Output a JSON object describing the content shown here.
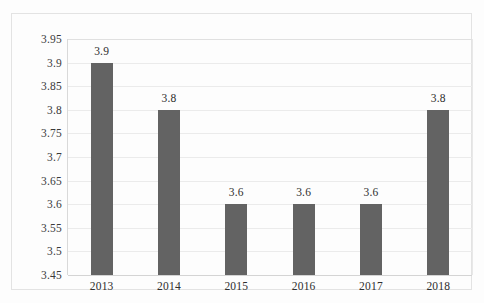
{
  "chart_data": {
    "type": "bar",
    "title": "",
    "subtitle": "",
    "xlabel": "",
    "ylabel": "",
    "categories": [
      "2013",
      "2014",
      "2015",
      "2016",
      "2017",
      "2018"
    ],
    "values": [
      3.9,
      3.8,
      3.6,
      3.6,
      3.6,
      3.8
    ],
    "data_labels": [
      "3.9",
      "3.8",
      "3.6",
      "3.6",
      "3.6",
      "3.8"
    ],
    "ylim": [
      3.45,
      3.95
    ],
    "ytick_values": [
      3.95,
      3.9,
      3.85,
      3.8,
      3.75,
      3.7,
      3.65,
      3.6,
      3.55,
      3.5,
      3.45
    ],
    "ytick_labels": [
      "3.95",
      "3.9",
      "3.85",
      "3.8",
      "3.75",
      "3.7",
      "3.65",
      "3.6",
      "3.55",
      "3.5",
      "3.45"
    ],
    "grid": true,
    "legend": false,
    "legend_position": "none",
    "colors": {
      "bar": "#636363",
      "gridline": "#ebebeb",
      "axis": "#d4d4d4",
      "frame": "#e3e3e3",
      "background": "#fdfdfd",
      "label_text": "#2e2e2e"
    }
  }
}
